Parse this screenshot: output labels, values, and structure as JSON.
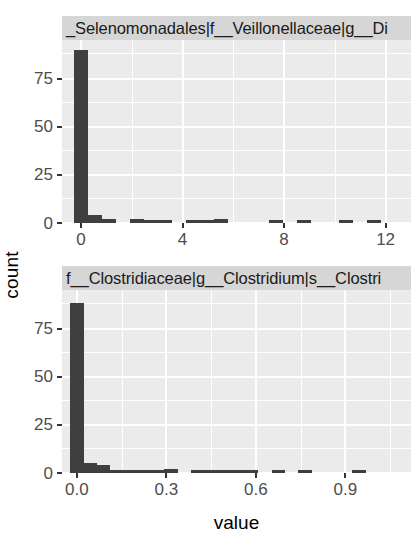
{
  "chart_data": {
    "type": "bar",
    "title": "",
    "xlabel": "value",
    "ylabel": "count",
    "grid": true,
    "legend": "none",
    "facets": [
      {
        "strip_label": "_Selenomonadales|f__Veillonellaceae|g__Di",
        "xlim": [
          -0.75,
          13.0
        ],
        "ylim": [
          0,
          95
        ],
        "xticks": [
          0,
          4,
          8,
          12
        ],
        "xtick_labels": [
          "0",
          "4",
          "8",
          "12"
        ],
        "yticks": [
          0,
          25,
          50,
          75
        ],
        "ytick_labels": [
          "0",
          "25",
          "50",
          "75"
        ],
        "bin_width": 0.55,
        "bins": [
          {
            "x": 0.0,
            "count": 90
          },
          {
            "x": 0.55,
            "count": 4
          },
          {
            "x": 1.1,
            "count": 2
          },
          {
            "x": 2.2,
            "count": 2
          },
          {
            "x": 2.75,
            "count": 1
          },
          {
            "x": 3.3,
            "count": 1
          },
          {
            "x": 4.4,
            "count": 1
          },
          {
            "x": 4.95,
            "count": 1
          },
          {
            "x": 5.5,
            "count": 2
          },
          {
            "x": 7.7,
            "count": 1
          },
          {
            "x": 8.8,
            "count": 1
          },
          {
            "x": 10.45,
            "count": 1
          },
          {
            "x": 11.55,
            "count": 1
          }
        ]
      },
      {
        "strip_label": "f__Clostridiaceae|g__Clostridium|s__Clostri",
        "xlim": [
          -0.05,
          1.12
        ],
        "ylim": [
          0,
          95
        ],
        "xticks": [
          0.0,
          0.3,
          0.6,
          0.9
        ],
        "xtick_labels": [
          "0.0",
          "0.3",
          "0.6",
          "0.9"
        ],
        "yticks": [
          0,
          25,
          50,
          75
        ],
        "ytick_labels": [
          "0",
          "25",
          "50",
          "75"
        ],
        "bin_width": 0.045,
        "bins": [
          {
            "x": 0.0,
            "count": 88
          },
          {
            "x": 0.045,
            "count": 5
          },
          {
            "x": 0.09,
            "count": 4
          },
          {
            "x": 0.135,
            "count": 1
          },
          {
            "x": 0.18,
            "count": 1
          },
          {
            "x": 0.225,
            "count": 1
          },
          {
            "x": 0.27,
            "count": 1
          },
          {
            "x": 0.315,
            "count": 2
          },
          {
            "x": 0.405,
            "count": 1
          },
          {
            "x": 0.45,
            "count": 1
          },
          {
            "x": 0.495,
            "count": 1
          },
          {
            "x": 0.54,
            "count": 1
          },
          {
            "x": 0.585,
            "count": 1
          },
          {
            "x": 0.675,
            "count": 1
          },
          {
            "x": 0.765,
            "count": 1
          },
          {
            "x": 0.945,
            "count": 1
          }
        ]
      }
    ],
    "colors": {
      "bar": "#3f3f3f",
      "panel_background": "#ebebeb",
      "gridline": "#ffffff",
      "strip_background": "#d6d6d6",
      "axis_text": "#4d4d4d",
      "figure_background": "#ffffff"
    }
  }
}
